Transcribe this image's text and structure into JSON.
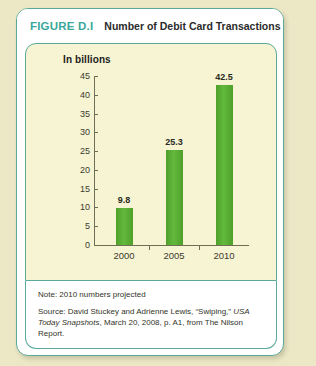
{
  "figure": {
    "number": "FIGURE D.I",
    "title": "Number of Debit Card Transactions",
    "note": "Note: 2010 numbers projected",
    "source_prefix": "Source: David Stuckey and Adrienne Lewis, “Swiping,” ",
    "source_italic": "USA Today Snapshots",
    "source_suffix": ", March 20, 2008, p. A1, from The Nilson Report."
  },
  "colors": {
    "accent_teal": "#3aa79b",
    "border_green": "#5aa99a",
    "bar_green": "#54a82f",
    "panel_cream": "#f7f4d4",
    "page_background": "#ece8c6"
  },
  "chart_data": {
    "type": "bar",
    "title": "Number of Debit Card Transactions",
    "subtitle": "In billions",
    "categories": [
      "2000",
      "2005",
      "2010"
    ],
    "values": [
      9.8,
      25.3,
      42.5
    ],
    "value_labels": [
      "9.8",
      "25.3",
      "42.5"
    ],
    "xlabel": "",
    "ylabel": "In billions",
    "ylim": [
      0,
      45
    ],
    "ytick_labels": [
      "45",
      "40",
      "35",
      "30",
      "25",
      "20",
      "15",
      "10",
      "5",
      "0"
    ],
    "ytick_values": [
      45,
      40,
      35,
      30,
      25,
      20,
      15,
      10,
      5,
      0
    ],
    "grid": false,
    "legend": "none",
    "series": [
      {
        "name": "Debit card transactions (billions)",
        "values": [
          9.8,
          25.3,
          42.5
        ]
      }
    ]
  }
}
